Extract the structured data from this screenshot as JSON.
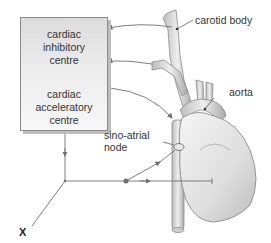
{
  "diagram": {
    "centre_box": {
      "inhibitory_label": "cardiac\ninhibitory\ncentre",
      "inhibitory_lines": [
        "cardiac",
        "inhibitory",
        "centre"
      ],
      "accelerator_lines": [
        "cardiac",
        "acceleratory",
        "centre"
      ]
    },
    "labels": {
      "carotid_body": "carotid body",
      "aorta": "aorta",
      "sa_node_line1": "sino-atrial",
      "sa_node_line2": "node",
      "x": "X"
    },
    "colors": {
      "line": "#6f6f6f",
      "box_border": "#8a8a8a",
      "organ_fill": "#d9d9d9",
      "organ_stroke": "#8c8c8c"
    }
  }
}
